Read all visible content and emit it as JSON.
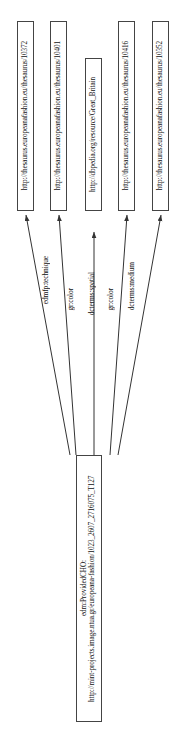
{
  "diagram": {
    "orientation": "rotated-90-ccw",
    "background_color": "#ffffff",
    "node_border_color": "#444444",
    "edge_color": "#333333",
    "text_color": "#111111"
  },
  "nodes": {
    "source": {
      "id": "source-node",
      "line1": "edm:ProvidedCHO:",
      "line2": "http://mint-projects.image.ntua.gr/europeana-fashion/1023_2607_2716075_T127"
    },
    "targets": [
      {
        "id": "target-node-10372",
        "label": "http://thesaurus.europeanafashion.eu/thesaurus/10372"
      },
      {
        "id": "target-node-10401",
        "label": "http://thesaurus.europeanafashion.eu/thesaurus/10401"
      },
      {
        "id": "target-node-great-britain",
        "label": "http://dbpedia.org/resource/Great_Britain"
      },
      {
        "id": "target-node-10416",
        "label": "http://thesaurus.europeanafashion.eu/thesaurus/10416"
      },
      {
        "id": "target-node-10352",
        "label": "http://thesaurus.europeanafashion.eu/thesaurus/10352"
      }
    ]
  },
  "edges": [
    {
      "id": "edge-technique",
      "label": "edmfp:technique",
      "from": "source-node",
      "to": "target-node-10372"
    },
    {
      "id": "edge-color-1",
      "label": "gr:color",
      "from": "source-node",
      "to": "target-node-10401"
    },
    {
      "id": "edge-spatial",
      "label": "dcterms:spatial",
      "from": "source-node",
      "to": "target-node-great-britain"
    },
    {
      "id": "edge-color-2",
      "label": "gr:color",
      "from": "source-node",
      "to": "target-node-10416"
    },
    {
      "id": "edge-medium",
      "label": "dcterms:medium",
      "from": "source-node",
      "to": "target-node-10352"
    }
  ]
}
